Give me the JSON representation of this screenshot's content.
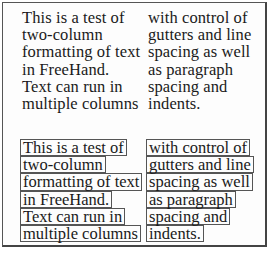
{
  "plain_text": {
    "column_1": [
      "This is a test of",
      "two-column",
      "formatting of text",
      "in FreeHand.",
      "Text can run in",
      "multiple columns"
    ],
    "column_2": [
      "with control of",
      "gutters and line",
      "spacing as well",
      "as paragraph",
      "spacing and",
      "indents."
    ]
  },
  "boxed_text": {
    "column_1": [
      "This is a test of",
      "two-column",
      "formatting of text",
      "in FreeHand.",
      "Text can run in",
      "multiple columns"
    ],
    "column_2": [
      "with control of",
      "gutters and line",
      "spacing as well",
      "as paragraph",
      "spacing and",
      "indents."
    ]
  }
}
